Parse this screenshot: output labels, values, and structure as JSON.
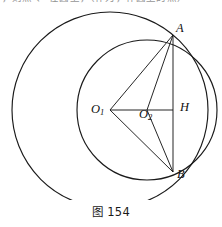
{
  "page": {
    "background_color": "#ffffff",
    "width": 222,
    "height": 227
  },
  "top_text": {
    "clipped_line": "，则点  、  在圆上，（作为，作圆上的点）"
  },
  "figure": {
    "caption": "图 154",
    "stroke_color": "#1a1a1a",
    "labels": {
      "point_a": "A",
      "point_b": "B",
      "point_h": "H",
      "center_o1_base": "O",
      "center_o1_sub": "1",
      "center_o2_base": "O",
      "center_o2_sub": "2"
    },
    "geometry": {
      "circle_large": {
        "cx": 110,
        "cy": 102,
        "r": 98,
        "label": "circle-o1"
      },
      "circle_small": {
        "cx": 147,
        "cy": 102,
        "r": 70,
        "label": "circle-o2"
      },
      "point_a": {
        "x": 173,
        "y": 27
      },
      "point_b": {
        "x": 173,
        "y": 164
      },
      "point_h": {
        "x": 173,
        "y": 102
      },
      "center_o1": {
        "x": 110,
        "y": 102
      },
      "center_o2": {
        "x": 147,
        "y": 102
      },
      "segments": [
        {
          "name": "o1-to-h-axis",
          "x1": 110,
          "y1": 102,
          "x2": 173,
          "y2": 102
        },
        {
          "name": "chord-ab",
          "x1": 173,
          "y1": 27,
          "x2": 173,
          "y2": 164
        },
        {
          "name": "radius-o1-a",
          "x1": 110,
          "y1": 102,
          "x2": 173,
          "y2": 27
        },
        {
          "name": "radius-o1-b",
          "x1": 110,
          "y1": 102,
          "x2": 173,
          "y2": 164
        },
        {
          "name": "radius-o2-a",
          "x1": 147,
          "y1": 102,
          "x2": 173,
          "y2": 27
        },
        {
          "name": "radius-o2-b",
          "x1": 147,
          "y1": 102,
          "x2": 173,
          "y2": 164
        }
      ]
    }
  }
}
